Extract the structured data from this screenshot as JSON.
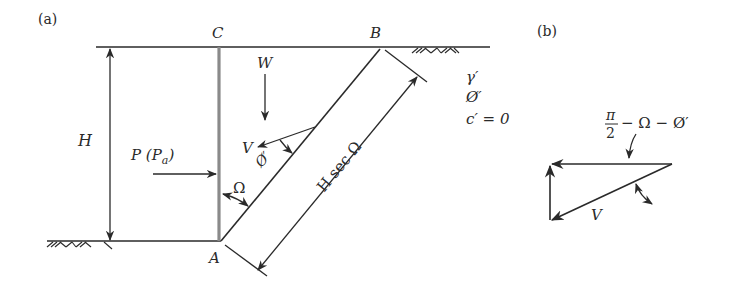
{
  "figure": {
    "panel_a": {
      "label": "(a)",
      "points": {
        "A": "A",
        "B": "B",
        "C": "C"
      },
      "weight_label": "W",
      "height_label": "H",
      "thrust_label_main": "P (P",
      "thrust_label_sub": "a",
      "thrust_label_close": ")",
      "wall_angle_label": "Ω",
      "reaction_label": "V",
      "friction_angle_label": "Ø′",
      "slip_length_label": "H sec Ω",
      "soil_properties": [
        "γ′",
        "Ø′",
        "c′ = 0"
      ]
    },
    "panel_b": {
      "label": "(b)",
      "angle_label_numerator": "π",
      "angle_label_denominator": "2",
      "angle_label_rest": "− Ω − Ø′",
      "reaction_label": "V"
    },
    "colors": {
      "ink": "#2a2a2a",
      "wall": "#8a8a8a",
      "background": "#ffffff"
    }
  }
}
